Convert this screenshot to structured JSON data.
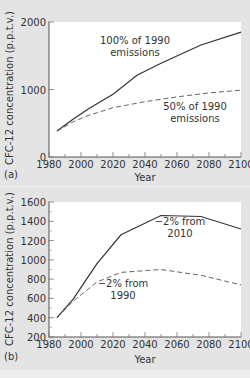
{
  "chart_data": [
    {
      "panel": "(a)",
      "type": "line",
      "title": "",
      "xlabel": "Year",
      "ylabel": "CFC-12 concentration (p.p.t.v.)",
      "xlim": [
        1980,
        2100
      ],
      "ylim": [
        0,
        2000
      ],
      "xticks": [
        1980,
        2000,
        2020,
        2040,
        2060,
        2080,
        2100
      ],
      "yticks": [
        0,
        1000,
        2000
      ],
      "grid": false,
      "series": [
        {
          "name": "100% of 1990 emissions",
          "style": "solid",
          "x": [
            1985,
            1995,
            2005,
            2020,
            2035,
            2050,
            2075,
            2100
          ],
          "values": [
            385,
            560,
            720,
            930,
            1210,
            1390,
            1660,
            1850
          ]
        },
        {
          "name": "50% of 1990 emissions",
          "style": "dashed",
          "x": [
            1985,
            1995,
            2005,
            2020,
            2040,
            2060,
            2080,
            2100
          ],
          "values": [
            385,
            520,
            620,
            730,
            820,
            890,
            950,
            990
          ]
        }
      ],
      "annotations": [
        {
          "text_line1": "100% of 1990",
          "text_line2": "emissions"
        },
        {
          "text_line1": "50% of 1990",
          "text_line2": "emissions"
        }
      ]
    },
    {
      "panel": "(b)",
      "type": "line",
      "title": "",
      "xlabel": "Year",
      "ylabel": "CFC-12 concentration (p.p.t.v.)",
      "xlim": [
        1980,
        2100
      ],
      "ylim": [
        200,
        1600
      ],
      "xticks": [
        1980,
        2000,
        2020,
        2040,
        2060,
        2080,
        2100
      ],
      "yticks": [
        200,
        400,
        600,
        800,
        1000,
        1200,
        1400,
        1600
      ],
      "grid": false,
      "series": [
        {
          "name": "−2% from 2010",
          "style": "solid",
          "x": [
            1985,
            1995,
            2010,
            2025,
            2050,
            2075,
            2100
          ],
          "values": [
            400,
            590,
            960,
            1260,
            1460,
            1450,
            1320
          ]
        },
        {
          "name": "−2% from 1990",
          "style": "dashed",
          "x": [
            1985,
            1995,
            2010,
            2025,
            2050,
            2075,
            2100
          ],
          "values": [
            400,
            570,
            770,
            870,
            900,
            840,
            740
          ]
        }
      ],
      "annotations": [
        {
          "text_line1": "−2% from",
          "text_line2": "2010"
        },
        {
          "text_line1": "−2% from",
          "text_line2": "1990"
        }
      ]
    }
  ]
}
